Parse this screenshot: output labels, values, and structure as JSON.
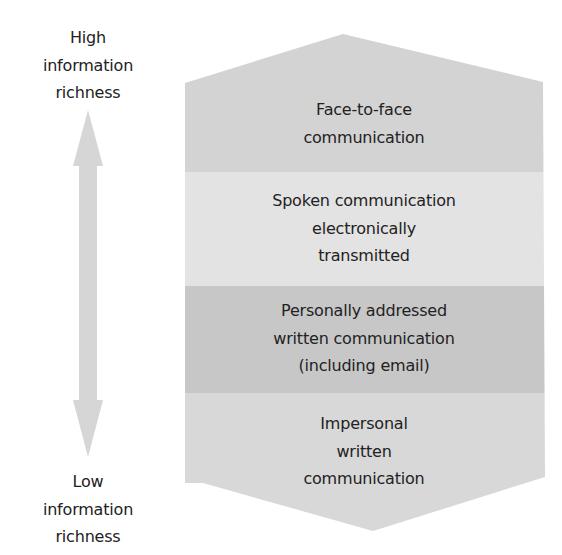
{
  "diagram": {
    "type": "information-richness-hierarchy",
    "axis": {
      "high_label": [
        "High",
        "information",
        "richness"
      ],
      "low_label": [
        "Low",
        "information",
        "richness"
      ],
      "arrow": "double-headed-vertical-arrow",
      "arrow_color": "#d6d6d6"
    },
    "bands": [
      {
        "label": [
          "Face-to-face",
          "communication"
        ],
        "color": "#d3d3d3"
      },
      {
        "label": [
          "Spoken communication",
          "electronically",
          "transmitted"
        ],
        "color": "#e3e3e3"
      },
      {
        "label": [
          "Personally addressed",
          "written communication",
          "(including email)"
        ],
        "color": "#c7c7c7"
      },
      {
        "label": [
          "Impersonal",
          "written",
          "communication"
        ],
        "color": "#d8d8d8"
      }
    ]
  }
}
